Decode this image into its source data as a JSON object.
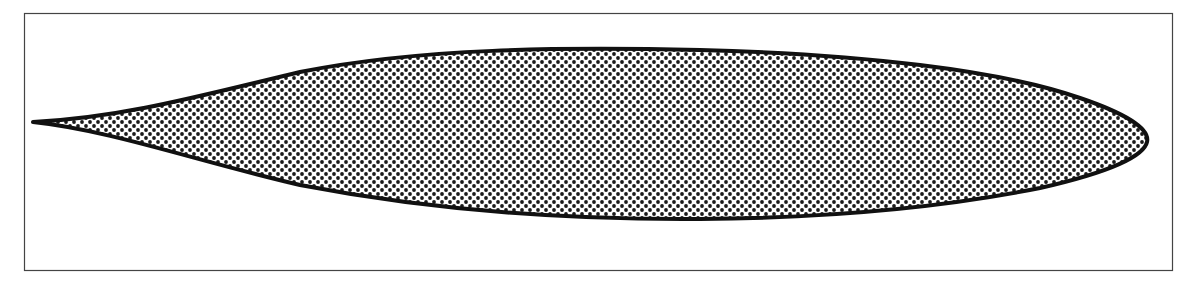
{
  "diagram": {
    "type": "airfoil-profile",
    "frame": {
      "x": 24,
      "y": 13,
      "width": 1148,
      "height": 257,
      "stroke": "#444444"
    },
    "airfoil": {
      "trailing_edge": [
        33,
        122
      ],
      "leading_edge": [
        1147,
        142
      ],
      "outline_color": "#111111",
      "fill_pattern": "halftone-dots",
      "dot_color": "#1a1a1a",
      "background": "#ffffff"
    },
    "labels": []
  }
}
